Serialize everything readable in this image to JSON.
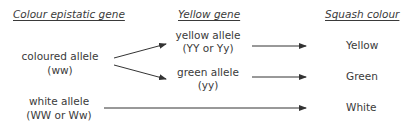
{
  "headers": {
    "epistatic": "Colour epistatic gene",
    "yellow_gene": "Yellow gene",
    "squash": "Squash colour"
  },
  "alleles": {
    "coloured": {
      "name": "coloured allele",
      "genotype": "(ww)"
    },
    "white": {
      "name": "white allele",
      "genotype": "(WW or Ww)"
    },
    "yellow": {
      "name": "yellow allele",
      "genotype": "(YY or Yy)"
    },
    "green": {
      "name": "green allele",
      "genotype": "(yy)"
    }
  },
  "outcomes": {
    "yellow": "Yellow",
    "green": "Green",
    "white": "White"
  },
  "colors": {
    "text": "#3a3a3a",
    "arrow": "#333333",
    "background": "#ffffff"
  }
}
